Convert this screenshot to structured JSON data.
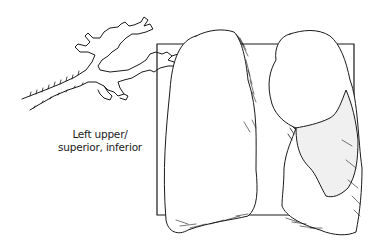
{
  "figure": {
    "caption_lines": [
      "Left upper/",
      "superior, inferior"
    ],
    "subjects": {
      "bronchial_tree": "bronchial-tree-sketch",
      "frame": "square-frame",
      "right_lung": "lung-left-in-image",
      "left_lung": "lung-right-in-image",
      "shaded_region": "stippled-lower-lobe-region"
    },
    "colors": {
      "ink": "#1a1a1a",
      "background": "#ffffff"
    }
  }
}
